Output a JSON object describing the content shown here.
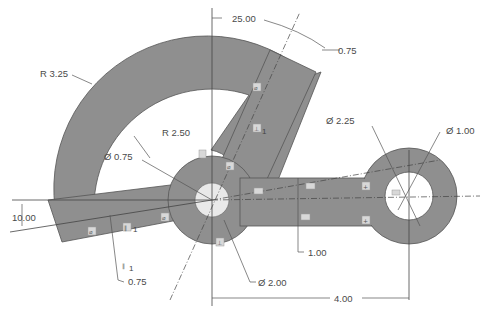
{
  "drawing": {
    "dimensions": {
      "angle_top": "25.00",
      "arm_width": "0.75",
      "outer_radius": "R 3.25",
      "inner_radius": "R 2.50",
      "hub_hole_dia": "Ø 0.75",
      "right_boss_dia": "Ø 2.25",
      "right_hole_dia": "Ø 1.00",
      "left_angle": "10.00",
      "left_arm_width": "0.75",
      "slot_width": "1.00",
      "hub_dia": "Ø 2.00",
      "center_distance": "4.00"
    },
    "constraints": {
      "perpendicular_count": "1",
      "parallel_count": "1",
      "parallel_count_lower": "1"
    },
    "colors": {
      "fill": "#8f8f8f",
      "edge": "#555555",
      "text": "#4a4a4a",
      "background": "#ffffff"
    }
  }
}
